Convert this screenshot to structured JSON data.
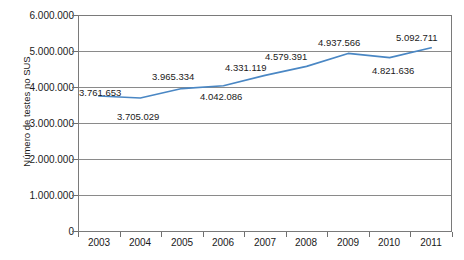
{
  "chart_data": {
    "type": "line",
    "title": "",
    "xlabel": "",
    "ylabel": "Número de testes no SUS",
    "categories": [
      "2003",
      "2004",
      "2005",
      "2006",
      "2007",
      "2008",
      "2009",
      "2010",
      "2011"
    ],
    "values": [
      3761653,
      3705029,
      3965334,
      4042086,
      4331119,
      4579391,
      4937566,
      4821636,
      5092711
    ],
    "point_labels": [
      "3.761.653",
      "3.705.029",
      "3.965.334",
      "4.042.086",
      "4.331.119",
      "4.579.391",
      "4.937.566",
      "4.821.636",
      "5.092.711"
    ],
    "ylim": [
      0,
      6000000
    ],
    "ytick_labels": [
      "6.000.000",
      "5.000.000",
      "4.000.000",
      "3.000.000",
      "2.000.000",
      "1.000.000",
      "0"
    ],
    "ytick_values": [
      6000000,
      5000000,
      4000000,
      3000000,
      2000000,
      1000000,
      0
    ],
    "grid": true,
    "legend": "none",
    "series": [
      {
        "name": "Número de testes no SUS",
        "color": "#4A87C4",
        "values": [
          3761653,
          3705029,
          3965334,
          4042086,
          4331119,
          4579391,
          4937566,
          4821636,
          5092711
        ]
      }
    ],
    "colors": {
      "line": "#4A87C4",
      "grid": "#8a8a8a",
      "frame": "#7a7a7a",
      "text": "#1a1a1a",
      "background": "#ffffff"
    }
  },
  "axis": {
    "y": {
      "t0": "6.000.000",
      "t1": "5.000.000",
      "t2": "4.000.000",
      "t3": "3.000.000",
      "t4": "2.000.000",
      "t5": "1.000.000",
      "t6": "0",
      "title": "Número de testes no SUS"
    },
    "x": {
      "c0": "2003",
      "c1": "2004",
      "c2": "2005",
      "c3": "2006",
      "c4": "2007",
      "c5": "2008",
      "c6": "2009",
      "c7": "2010",
      "c8": "2011"
    }
  },
  "labels": {
    "p0": "3.761.653",
    "p1": "3.705.029",
    "p2": "3.965.334",
    "p3": "4.042.086",
    "p4": "4.331.119",
    "p5": "4.579.391",
    "p6": "4.937.566",
    "p7": "4.821.636",
    "p8": "5.092.711"
  }
}
